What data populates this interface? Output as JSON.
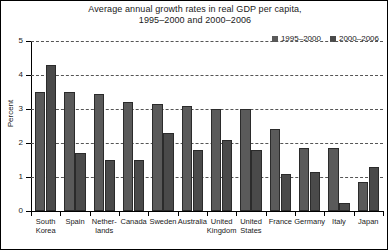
{
  "chart_data": {
    "type": "bar",
    "title": "Average annual growth rates in real GDP per capita, 1995–2000 and 2000–2006",
    "title_lines": [
      "Average annual growth rates in real GDP per capita,",
      "1995–2000 and 2000–2006"
    ],
    "xlabel": "",
    "ylabel": "Percent",
    "ylim": [
      0,
      5
    ],
    "yticks": [
      0,
      1,
      2,
      3,
      4,
      5
    ],
    "ytick_labels": [
      "0",
      "1",
      "2",
      "3",
      "4",
      "5"
    ],
    "grid": true,
    "legend_position": "top-right",
    "categories": [
      "South Korea",
      "Spain",
      "Netherlands",
      "Canada",
      "Sweden",
      "Australia",
      "United Kingdom",
      "United States",
      "France",
      "Germany",
      "Italy",
      "Japan"
    ],
    "category_label_lines": [
      [
        "South",
        "Korea"
      ],
      [
        "Spain"
      ],
      [
        "Nether-",
        "lands"
      ],
      [
        "Canada"
      ],
      [
        "Sweden"
      ],
      [
        "Australia"
      ],
      [
        "United",
        "Kingdom"
      ],
      [
        "United",
        "States"
      ],
      [
        "France"
      ],
      [
        "Germany"
      ],
      [
        "Italy"
      ],
      [
        "Japan"
      ]
    ],
    "series": [
      {
        "name": "1995–2000",
        "color": "#5a5a5a",
        "values": [
          3.5,
          3.5,
          3.45,
          3.2,
          3.15,
          3.1,
          3.0,
          3.0,
          2.4,
          1.85,
          1.85,
          0.85
        ]
      },
      {
        "name": "2000–2006",
        "color": "#4a4a4a",
        "values": [
          4.3,
          1.7,
          1.5,
          1.5,
          2.3,
          1.8,
          2.1,
          1.8,
          1.1,
          1.15,
          0.25,
          1.3
        ]
      }
    ]
  },
  "style": {
    "frame_color": "#000000",
    "axis_color": "#000000",
    "grid_color": "#555555",
    "text_color": "#1a1a1a",
    "background": "#ffffff"
  }
}
